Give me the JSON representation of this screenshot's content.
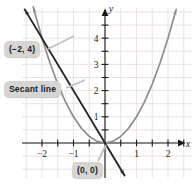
{
  "figure": {
    "width": 195,
    "height": 184,
    "background": "#ffffff"
  },
  "colors": {
    "grid": "#e8dede",
    "axis": "#1a1a1a",
    "curve": "#8c8c8c",
    "secant": "#262626",
    "callout_bg": "#d7d5d2",
    "callout_text": "#1a1a1a",
    "leader": "#b9b6b2"
  },
  "axes": {
    "x_label": "x",
    "y_label": "y",
    "x_ticks": [
      {
        "value": -2,
        "label": "−2"
      },
      {
        "value": -1.5,
        "label": ""
      },
      {
        "value": -1,
        "label": "−1"
      },
      {
        "value": -0.5,
        "label": ""
      },
      {
        "value": 0.5,
        "label": ""
      },
      {
        "value": 1,
        "label": "1"
      },
      {
        "value": 1.5,
        "label": ""
      },
      {
        "value": 2,
        "label": "2"
      },
      {
        "value": 2.5,
        "label": ""
      }
    ],
    "y_ticks": [
      {
        "value": 0.5,
        "label": ""
      },
      {
        "value": 1,
        "label": "1"
      },
      {
        "value": 1.5,
        "label": ""
      },
      {
        "value": 2,
        "label": "2"
      },
      {
        "value": 2.5,
        "label": ""
      },
      {
        "value": 3,
        "label": "3"
      },
      {
        "value": 3.5,
        "label": ""
      },
      {
        "value": 4,
        "label": "4"
      },
      {
        "value": 4.5,
        "label": ""
      }
    ],
    "xlim": [
      -2.6,
      2.75
    ],
    "ylim": [
      -1.35,
      5.2
    ],
    "grid": true
  },
  "callouts": {
    "point_a": "(−2, 4)",
    "secant": "Secant line",
    "origin": "(0, 0)"
  },
  "chart_data": {
    "type": "line",
    "title": "",
    "xlabel": "x",
    "ylabel": "y",
    "xlim": [
      -2.6,
      2.75
    ],
    "ylim": [
      -1.35,
      5.2
    ],
    "grid": true,
    "legend": "none",
    "series": [
      {
        "name": "parabola",
        "equation": "y = x^2",
        "color": "#8c8c8c",
        "arrowheads": "both",
        "x": [
          -2.28,
          -2.0,
          -1.75,
          -1.5,
          -1.25,
          -1.0,
          -0.75,
          -0.5,
          -0.25,
          0,
          0.25,
          0.5,
          0.75,
          1.0,
          1.25,
          1.5,
          1.75,
          2.0,
          2.26
        ],
        "y": [
          5.2,
          4.0,
          3.0625,
          2.25,
          1.5625,
          1.0,
          0.5625,
          0.25,
          0.0625,
          0,
          0.0625,
          0.25,
          0.5625,
          1.0,
          1.5625,
          2.25,
          3.0625,
          4.0,
          5.1
        ]
      },
      {
        "name": "secant-line",
        "equation": "y = -2x",
        "color": "#262626",
        "arrowheads": "both",
        "through_points": [
          [
            -2,
            4
          ],
          [
            0,
            0
          ]
        ],
        "slope": -2,
        "x": [
          -2.55,
          0.62
        ],
        "y": [
          5.1,
          -1.24
        ]
      }
    ],
    "annotations": [
      {
        "text": "(−2, 4)",
        "point": [
          -2,
          4
        ]
      },
      {
        "text": "Secant line",
        "point": [
          -1.55,
          3.1
        ]
      },
      {
        "text": "(0, 0)",
        "point": [
          0,
          0
        ]
      }
    ]
  }
}
